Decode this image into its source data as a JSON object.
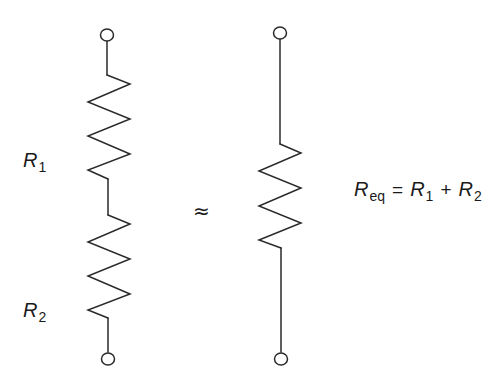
{
  "diagram": {
    "colors": {
      "line": "#2a2a2a",
      "text": "#1a1a1a",
      "background": "#ffffff"
    },
    "left_circuit": {
      "resistors": [
        {
          "id": "R1",
          "label_main": "R",
          "label_sub": "1"
        },
        {
          "id": "R2",
          "label_main": "R",
          "label_sub": "2"
        }
      ],
      "terminals": [
        "top",
        "bottom"
      ]
    },
    "relation_symbol": "≈",
    "right_circuit": {
      "resistors": [
        {
          "id": "Req"
        }
      ],
      "terminals": [
        "top",
        "bottom"
      ]
    },
    "equation": {
      "lhs_main": "R",
      "lhs_sub": "eq",
      "equals": "=",
      "term1_main": "R",
      "term1_sub": "1",
      "plus": "+",
      "term2_main": "R",
      "term2_sub": "2"
    }
  }
}
